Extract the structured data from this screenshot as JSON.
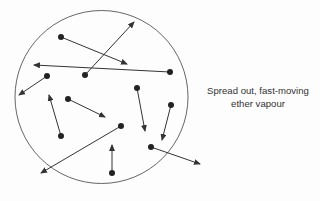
{
  "diagram": {
    "label": {
      "line1": "Spread out, fast-moving",
      "line2": "ether vapour"
    },
    "container": {
      "shape": "circle",
      "cx": 101.5,
      "cy": 97,
      "r": 86.5
    },
    "particles": [
      {
        "x": 61,
        "y": 37,
        "tx": 127,
        "ty": 64
      },
      {
        "x": 85,
        "y": 75,
        "tx": 134,
        "ty": 22
      },
      {
        "x": 170,
        "y": 72,
        "tx": 34,
        "ty": 65
      },
      {
        "x": 47,
        "y": 76,
        "tx": 19,
        "ty": 95
      },
      {
        "x": 68,
        "y": 99,
        "tx": 105,
        "ty": 117
      },
      {
        "x": 61,
        "y": 136,
        "tx": 49,
        "ty": 95
      },
      {
        "x": 137,
        "y": 88,
        "tx": 145,
        "ty": 131
      },
      {
        "x": 171,
        "y": 105,
        "tx": 162,
        "ty": 140
      },
      {
        "x": 121,
        "y": 126,
        "tx": 41,
        "ty": 173
      },
      {
        "x": 112,
        "y": 173,
        "tx": 112,
        "ty": 145
      },
      {
        "x": 151,
        "y": 147,
        "tx": 200,
        "ty": 164
      }
    ],
    "colors": {
      "stroke": "#333333",
      "dot": "#222222",
      "background": "#fdfdfd"
    }
  }
}
